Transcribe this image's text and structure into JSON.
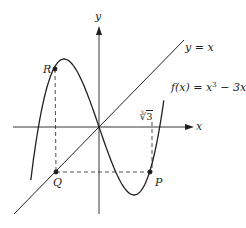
{
  "diagram": {
    "type": "function-graph",
    "colors": {
      "ink": "#231f20",
      "background": "#ffffff"
    },
    "axes": {
      "x_label": "x",
      "y_label": "y",
      "origin_px": [
        99,
        127
      ],
      "x_range_px": [
        13,
        194
      ],
      "y_range_px": [
        225,
        26
      ]
    },
    "curves": [
      {
        "name": "cubic",
        "label": "f(x) = x³ − 3x",
        "label_parts": {
          "lhs": "f(x) = x",
          "exp": "3",
          "rhs": " − 3x"
        },
        "equation": "x^3 - 3x"
      },
      {
        "name": "identity-line",
        "label": "y = x",
        "equation": "x"
      }
    ],
    "points": [
      {
        "name": "R",
        "label": "R",
        "px": [
          55,
          69
        ]
      },
      {
        "name": "Q",
        "label": "Q",
        "px": [
          56,
          172
        ]
      },
      {
        "name": "P",
        "label": "P",
        "px": [
          150,
          172
        ]
      }
    ],
    "annotations": {
      "tick_label": "∛3",
      "tick_label_parts": {
        "index": "3",
        "radical": "√",
        "radicand": "3"
      }
    },
    "scale": {
      "px_per_unit_x": 35,
      "px_per_unit_y": 34
    }
  }
}
